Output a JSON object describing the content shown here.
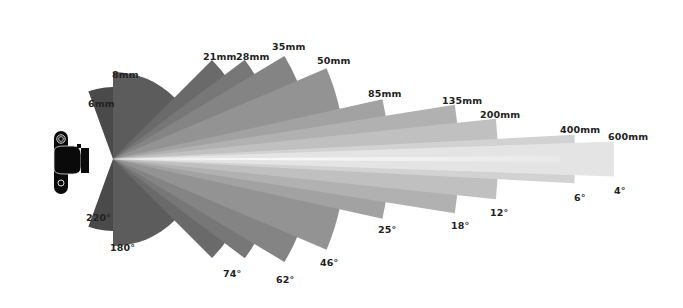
{
  "diagram": {
    "apex": {
      "x": 113,
      "y": 159
    },
    "camera_icon": "camera-top-view-icon",
    "lenses": [
      {
        "focal": "6mm",
        "angle": "220°",
        "fov": 220,
        "radius": 72,
        "color": "#4a4a4a",
        "focal_pos": [
          88,
          98
        ],
        "angle_pos": [
          86,
          212
        ]
      },
      {
        "focal": "8mm",
        "angle": "180°",
        "fov": 180,
        "radius": 87,
        "color": "#5c5c5c",
        "focal_pos": [
          112,
          69
        ],
        "angle_pos": [
          110,
          242
        ]
      },
      {
        "focal": "21mm",
        "angle": "90°",
        "fov": 90,
        "radius": 140,
        "color": "#6a6a6a",
        "focal_pos": [
          203,
          51
        ],
        "angle_pos": null
      },
      {
        "focal": "28mm",
        "angle": "74°",
        "fov": 74,
        "radius": 165,
        "color": "#777777",
        "focal_pos": [
          236,
          51
        ],
        "angle_pos": [
          223,
          268
        ]
      },
      {
        "focal": "35mm",
        "angle": "62°",
        "fov": 62,
        "radius": 200,
        "color": "#848484",
        "focal_pos": [
          272,
          41
        ],
        "angle_pos": [
          276,
          274
        ]
      },
      {
        "focal": "50mm",
        "angle": "46°",
        "fov": 46,
        "radius": 232,
        "color": "#939393",
        "focal_pos": [
          317,
          55
        ],
        "angle_pos": [
          320,
          257
        ]
      },
      {
        "focal": "85mm",
        "angle": "25°",
        "fov": 25,
        "radius": 276,
        "color": "#a2a2a2",
        "focal_pos": [
          368,
          88
        ],
        "angle_pos": [
          378,
          224
        ]
      },
      {
        "focal": "135mm",
        "angle": "18°",
        "fov": 18,
        "radius": 346,
        "color": "#b1b1b1",
        "focal_pos": [
          442,
          95
        ],
        "angle_pos": [
          451,
          220
        ]
      },
      {
        "focal": "200mm",
        "angle": "12°",
        "fov": 12,
        "radius": 385,
        "color": "#c0c0c0",
        "focal_pos": [
          480,
          109
        ],
        "angle_pos": [
          490,
          207
        ]
      },
      {
        "focal": "400mm",
        "angle": "6°",
        "fov": 6,
        "radius": 462,
        "color": "#d2d2d2",
        "focal_pos": [
          560,
          124
        ],
        "angle_pos": [
          574,
          192
        ]
      },
      {
        "focal": "600mm",
        "angle": "4°",
        "fov": 4,
        "radius": 501,
        "color": "#e4e4e4",
        "focal_pos": [
          608,
          131
        ],
        "angle_pos": [
          614,
          185
        ]
      }
    ]
  }
}
